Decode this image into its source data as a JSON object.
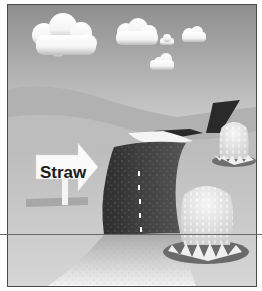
{
  "illustration": {
    "sign": {
      "label": "Straw"
    },
    "colors": {
      "sky_top": "#8e8e8e",
      "sky_bottom": "#e6e6e6",
      "hill_far": "#b3b3b3",
      "hill_mid": "#c2c2c2",
      "ground": "#c8c8c8",
      "road": "#3a3a3a",
      "road_edge": "#f2f2f2",
      "straw_base": "#6e6e6e",
      "frame": "#4a4a4a"
    }
  }
}
